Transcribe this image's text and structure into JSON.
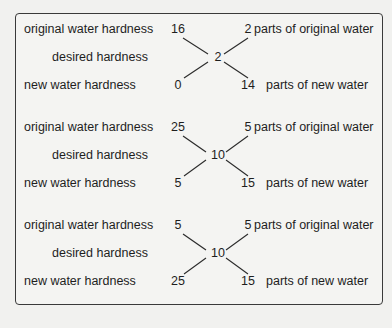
{
  "labels": {
    "original_hardness": "original water hardness",
    "desired_hardness": "desired hardness",
    "new_hardness": "new water hardness",
    "parts_original": "parts of original water",
    "parts_new": "parts of new water"
  },
  "examples": [
    {
      "original_hardness": "16",
      "desired_hardness": "2",
      "new_hardness": "0",
      "parts_original": "2",
      "parts_new": "14"
    },
    {
      "original_hardness": "25",
      "desired_hardness": "10",
      "new_hardness": "5",
      "parts_original": "5",
      "parts_new": "15"
    },
    {
      "original_hardness": "5",
      "desired_hardness": "10",
      "new_hardness": "25",
      "parts_original": "5",
      "parts_new": "15"
    }
  ]
}
